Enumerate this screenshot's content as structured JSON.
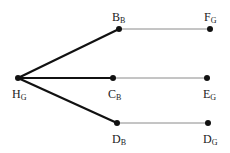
{
  "diagram": {
    "nodes": [
      {
        "id": "H",
        "main": "H",
        "sub": "G",
        "x": 18,
        "y": 78,
        "lx": 12,
        "ly": 98
      },
      {
        "id": "B",
        "main": "B",
        "sub": "B",
        "x": 119,
        "y": 29,
        "lx": 112,
        "ly": 21
      },
      {
        "id": "C",
        "main": "C",
        "sub": "B",
        "x": 113,
        "y": 78,
        "lx": 108,
        "ly": 98
      },
      {
        "id": "D1",
        "main": "D",
        "sub": "B",
        "x": 117,
        "y": 123,
        "lx": 112,
        "ly": 143
      },
      {
        "id": "F",
        "main": "F",
        "sub": "G",
        "x": 210,
        "y": 29,
        "lx": 204,
        "ly": 21
      },
      {
        "id": "E",
        "main": "E",
        "sub": "G",
        "x": 207,
        "y": 78,
        "lx": 203,
        "ly": 98
      },
      {
        "id": "D2",
        "main": "D",
        "sub": "G",
        "x": 208,
        "y": 123,
        "lx": 203,
        "ly": 143
      }
    ],
    "edges": [
      {
        "from": "H",
        "to": "B",
        "weight": "bold"
      },
      {
        "from": "H",
        "to": "C",
        "weight": "bold"
      },
      {
        "from": "H",
        "to": "D1",
        "weight": "bold"
      },
      {
        "from": "B",
        "to": "F",
        "weight": "thin"
      },
      {
        "from": "C",
        "to": "E",
        "weight": "thin"
      },
      {
        "from": "D1",
        "to": "D2",
        "weight": "thin"
      }
    ],
    "colors": {
      "bold_edge": "#111111",
      "thin_edge": "#8a8a8a",
      "node": "#111111"
    }
  }
}
